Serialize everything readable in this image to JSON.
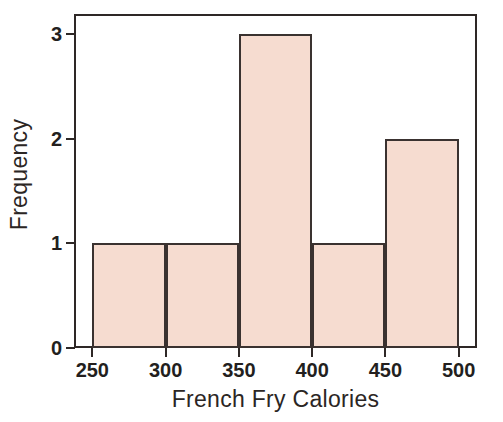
{
  "chart_data": {
    "type": "bar",
    "title": "",
    "subtitle": "",
    "xlabel": "French Fry Calories",
    "ylabel": "Frequency",
    "bin_edges": [
      250,
      300,
      350,
      400,
      450,
      500
    ],
    "categories": [
      "250-300",
      "300-350",
      "350-400",
      "400-450",
      "450-500"
    ],
    "values": [
      1,
      1,
      3,
      1,
      2
    ],
    "xtick_labels": [
      "250",
      "300",
      "350",
      "400",
      "450",
      "500"
    ],
    "xtick_values": [
      250,
      300,
      350,
      400,
      450,
      500
    ],
    "ytick_labels": [
      "0",
      "1",
      "2",
      "3"
    ],
    "ytick_values": [
      0,
      1,
      2,
      3
    ],
    "xlim": [
      237.5,
      512.5
    ],
    "ylim": [
      0,
      3.19
    ],
    "grid": false,
    "legend": null,
    "bar_fill_color": "#f6dcd0",
    "bar_edge_color": "#3a3230",
    "axis_color": "#2e2826",
    "background_color": "#ffffff",
    "annotations": []
  }
}
